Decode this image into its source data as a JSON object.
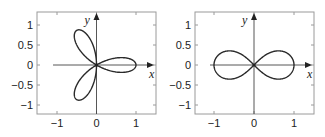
{
  "chart_data": [
    {
      "type": "line",
      "title": "",
      "description": "Three-leaved rose r = cos(3θ)",
      "xlabel": "x",
      "ylabel": "y",
      "xlim": [
        -1.3,
        1.5
      ],
      "ylim": [
        -1.2,
        1.3
      ],
      "xticks": [
        -1,
        0,
        1
      ],
      "xtick_labels": [
        "−1",
        "0",
        "1"
      ],
      "yticks": [
        -1,
        -0.5,
        0,
        0.5,
        1
      ],
      "ytick_labels": [
        "−1",
        "−0.5",
        "0",
        "0.5",
        "1"
      ],
      "grid": false,
      "legend": null,
      "curve": {
        "kind": "rose",
        "k": 3,
        "samples": 360
      },
      "frame": {
        "left": 37,
        "top": 12,
        "right": 156,
        "bottom": 114,
        "x0": 96.5,
        "y0": 65,
        "xunit": 39.5,
        "yunit": 40
      }
    },
    {
      "type": "line",
      "title": "",
      "description": "Lemniscate of Bernoulli r² = cos(2θ)",
      "xlabel": "x",
      "ylabel": "y",
      "xlim": [
        -1.3,
        1.5
      ],
      "ylim": [
        -1.2,
        1.3
      ],
      "xticks": [
        -1,
        0,
        1
      ],
      "xtick_labels": [
        "−1",
        "0",
        "1"
      ],
      "yticks": [
        -1,
        -0.5,
        0,
        0.5,
        1
      ],
      "ytick_labels": [
        "−1",
        "−0.5",
        "0",
        "0.5",
        "1"
      ],
      "grid": false,
      "legend": null,
      "curve": {
        "kind": "lemniscate",
        "samples": 400
      },
      "frame": {
        "left": 195,
        "top": 12,
        "right": 314,
        "bottom": 114,
        "x0": 254,
        "y0": 65,
        "xunit": 40,
        "yunit": 40
      }
    }
  ],
  "colors": {
    "curve": "#2a2a2a",
    "axis": "#444444",
    "frame": "#9a9a9a",
    "tick": "#9a9a9a"
  }
}
